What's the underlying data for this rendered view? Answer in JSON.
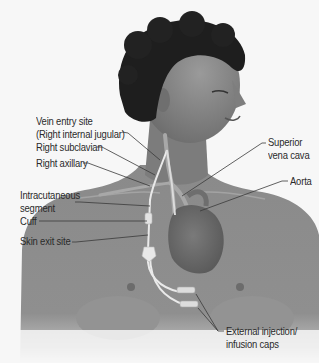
{
  "figure": {
    "colors": {
      "background": "#f7f7f7",
      "skin": "#8d8d8d",
      "hair": "#1e1e1e",
      "heart": "#6e6e6e",
      "catheter": "#e8e8e8",
      "leader_line": "#3a3a3a",
      "label_text": "#2a2a2a"
    }
  },
  "labels": {
    "vein_entry_line1": "Vein entry site",
    "vein_entry_line2": "(Right internal jugular)",
    "right_subclavian": "Right subclavian",
    "right_axillary": "Right axillary",
    "intracutaneous_line1": "Intracutaneous",
    "intracutaneous_line2": "segment",
    "cuff": "Cuff",
    "skin_exit": "Skin exit site",
    "svc_line1": "Superior",
    "svc_line2": "vena cava",
    "aorta": "Aorta",
    "caps_line1": "External injection/",
    "caps_line2": "infusion caps"
  }
}
